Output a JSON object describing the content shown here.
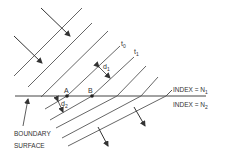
{
  "diagram": {
    "labels": {
      "t0": "t",
      "t0_sub": "0",
      "t1": "t",
      "t1_sub": "1",
      "d1": "d",
      "d1_sub": "1",
      "d2": "d",
      "d2_sub": "2",
      "point_a": "A",
      "point_b": "B",
      "index_upper": "INDEX = N",
      "index_upper_sub": "1",
      "index_lower": "INDEX = N",
      "index_lower_sub": "2",
      "boundary_line1": "BOUNDARY",
      "boundary_line2": "SURFACE"
    },
    "colors": {
      "line": "#444444",
      "text": "#333333",
      "background": "#ffffff"
    }
  }
}
